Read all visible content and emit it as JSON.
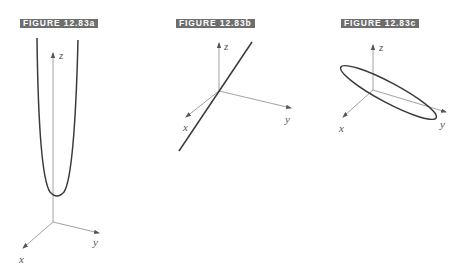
{
  "figures": [
    {
      "label": "FIGURE 12.83a",
      "description": "Vertical parabola-shaped curve opening upward above xy-plane",
      "axes": {
        "x": "x",
        "y": "y",
        "z": "z"
      }
    },
    {
      "label": "FIGURE 12.83b",
      "description": "Straight line passing near the origin",
      "axes": {
        "x": "x",
        "y": "y",
        "z": "z"
      }
    },
    {
      "label": "FIGURE 12.83c",
      "description": "Tilted ellipse around the origin",
      "axes": {
        "x": "x",
        "y": "y",
        "z": "z"
      }
    }
  ],
  "colors": {
    "label_background": "#6e6e6e",
    "label_text": "#ffffff",
    "curve": "#3a3a3a",
    "axis": "#8a8a8a"
  }
}
